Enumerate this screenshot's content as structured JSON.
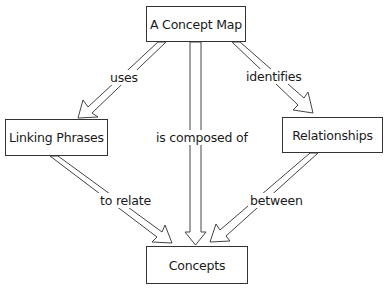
{
  "nodes": {
    "concept_map": "A Concept Map",
    "linking_phrases": "Linking Phrases",
    "relationships": "Relationships",
    "concepts": "Concepts"
  },
  "links": {
    "uses": "uses",
    "is_composed_of": "is composed of",
    "identifies": "identifies",
    "to_relate": "to relate",
    "between": "between"
  },
  "colors": {
    "stroke": "#333333",
    "background": "#ffffff"
  }
}
